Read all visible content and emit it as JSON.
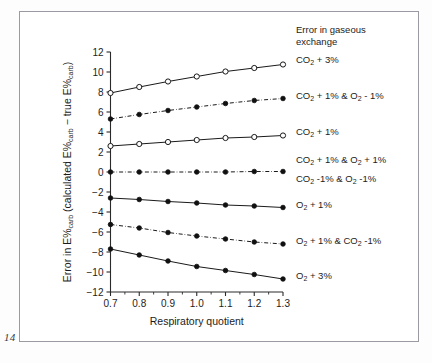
{
  "page": {
    "number": "14"
  },
  "chart_data": {
    "type": "line",
    "title": "",
    "legend_title_line1": "Error in gaseous",
    "legend_title_line2": "exchange",
    "legend_position": "right-of-plot-inline-labels",
    "grid": false,
    "xlabel": "Respiratory  quotient",
    "ylabel_parts": {
      "pre": "Error in E%",
      "sub1": "carb",
      "mid": " (calculated E%",
      "sub2": "carb",
      "mid2": " − true E%",
      "sub3": "carb",
      "post": ")"
    },
    "ylabel_plain": "Error in E%carb (calculated E%carb − true E%carb)",
    "xlim": [
      0.7,
      1.3
    ],
    "ylim": [
      -12,
      12
    ],
    "x": [
      0.7,
      0.8,
      0.9,
      1.0,
      1.1,
      1.2,
      1.3
    ],
    "xticks": [
      "0.7",
      "0.8",
      "0.9",
      "1.0",
      "1.1",
      "1.2",
      "1.3"
    ],
    "yticks": [
      "12",
      "10",
      "8",
      "6",
      "4",
      "2",
      "0",
      "−2",
      "−4",
      "−6",
      "−8",
      "−10",
      "−12"
    ],
    "ytick_values": [
      12,
      10,
      8,
      6,
      4,
      2,
      0,
      -2,
      -4,
      -6,
      -8,
      -10,
      -12
    ],
    "series": [
      {
        "name": "CO2 + 3%",
        "label_parts": [
          {
            "t": "CO",
            "sub": false
          },
          {
            "t": "2",
            "sub": true
          },
          {
            "t": " + 3%",
            "sub": false
          }
        ],
        "marker": "open-circle",
        "line": "solid",
        "values": [
          7.9,
          8.5,
          9.05,
          9.55,
          10.05,
          10.4,
          10.75
        ],
        "label_y": 10.95
      },
      {
        "name": "CO2 + 1% & O2 - 1%",
        "label_parts": [
          {
            "t": "CO",
            "sub": false
          },
          {
            "t": "2",
            "sub": true
          },
          {
            "t": " + 1% & O",
            "sub": false
          },
          {
            "t": "2",
            "sub": true
          },
          {
            "t": " - 1%",
            "sub": false
          }
        ],
        "marker": "filled-circle",
        "line": "dashdot",
        "values": [
          5.3,
          5.75,
          6.15,
          6.5,
          6.85,
          7.15,
          7.35
        ],
        "label_y": 7.35
      },
      {
        "name": "CO2 + 1%",
        "label_parts": [
          {
            "t": "CO",
            "sub": false
          },
          {
            "t": "2",
            "sub": true
          },
          {
            "t": " + 1%",
            "sub": false
          }
        ],
        "marker": "open-circle",
        "line": "solid",
        "values": [
          2.6,
          2.8,
          3.0,
          3.2,
          3.4,
          3.5,
          3.65
        ],
        "label_y": 3.75
      },
      {
        "name": "CO2 + 1% & O2 + 1% / CO2 -1% & O2 -1%",
        "label_parts": [
          {
            "t": "CO",
            "sub": false
          },
          {
            "t": "2",
            "sub": true
          },
          {
            "t": " + 1% & O",
            "sub": false
          },
          {
            "t": "2",
            "sub": true
          },
          {
            "t": " + 1%",
            "sub": false
          }
        ],
        "label_parts2": [
          {
            "t": "CO",
            "sub": false
          },
          {
            "t": "2",
            "sub": true
          },
          {
            "t": " -1% & O",
            "sub": false
          },
          {
            "t": "2",
            "sub": true
          },
          {
            "t": " -1%",
            "sub": false
          }
        ],
        "marker": "filled-circle",
        "line": "dashdot",
        "values": [
          0.0,
          0.0,
          0.0,
          0.0,
          0.0,
          0.05,
          0.05
        ],
        "label_y": 0.9,
        "label_y2": -0.95
      },
      {
        "name": "O2 + 1%",
        "label_parts": [
          {
            "t": "O",
            "sub": false
          },
          {
            "t": "2",
            "sub": true
          },
          {
            "t": " + 1%",
            "sub": false
          }
        ],
        "marker": "filled-circle",
        "line": "solid",
        "values": [
          -2.6,
          -2.75,
          -2.95,
          -3.1,
          -3.3,
          -3.4,
          -3.55
        ],
        "label_y": -3.55
      },
      {
        "name": "O2 + 1% & CO2 -1%",
        "label_parts": [
          {
            "t": "O",
            "sub": false
          },
          {
            "t": "2",
            "sub": true
          },
          {
            "t": " + 1% & CO",
            "sub": false
          },
          {
            "t": "2",
            "sub": true
          },
          {
            "t": " -1%",
            "sub": false
          }
        ],
        "marker": "filled-circle",
        "line": "dashdot",
        "values": [
          -5.25,
          -5.6,
          -6.05,
          -6.4,
          -6.7,
          -7.0,
          -7.2
        ],
        "label_y": -7.2
      },
      {
        "name": "O2 + 3%",
        "label_parts": [
          {
            "t": "O",
            "sub": false
          },
          {
            "t": "2",
            "sub": true
          },
          {
            "t": " + 3%",
            "sub": false
          }
        ],
        "marker": "filled-circle",
        "line": "solid",
        "values": [
          -7.7,
          -8.3,
          -8.9,
          -9.45,
          -9.85,
          -10.25,
          -10.7
        ],
        "label_y": -10.7
      }
    ]
  }
}
